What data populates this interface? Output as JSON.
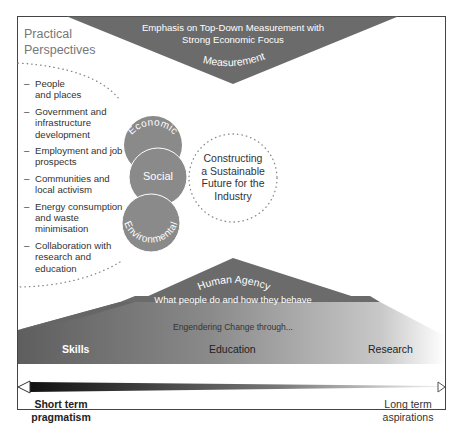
{
  "measurement": {
    "heading_line1": "Emphasis on Top-Down Measurement with",
    "heading_line2": "Strong Economic Focus",
    "label": "Measurement"
  },
  "practical_perspectives": {
    "title_line1": "Practical",
    "title_line2": "Perspectives",
    "items": [
      {
        "lines": [
          "People",
          "and places"
        ]
      },
      {
        "lines": [
          "Government and",
          "infrastructure",
          "development"
        ]
      },
      {
        "lines": [
          "Employment and job",
          "prospects"
        ]
      },
      {
        "lines": [
          "Communities and",
          "local activism"
        ]
      },
      {
        "lines": [
          "Energy consumption",
          "and waste",
          "minimisation"
        ]
      },
      {
        "lines": [
          "Collaboration with",
          "research and",
          "education"
        ]
      }
    ],
    "bullet": "–"
  },
  "pillars": {
    "economic": "Economic",
    "social": "Social",
    "environmental": "Environmental"
  },
  "goal": {
    "lines": [
      "Constructing",
      "a Sustainable",
      "Future for the",
      "Industry"
    ]
  },
  "human_agency": {
    "title": "Human Agency",
    "subtitle": "What people do and how they behave"
  },
  "change": {
    "heading": "Engendering Change through...",
    "skills": "Skills",
    "education": "Education",
    "research": "Research"
  },
  "timeline": {
    "left_line1": "Short term",
    "left_line2": "pragmatism",
    "right_line1": "Long term",
    "right_line2": "aspirations"
  },
  "colors": {
    "dark_grey": "#6b6b6b",
    "circle_grey": "#8a8a8a",
    "frame": "#444444",
    "text": "#333333",
    "muted_text": "#777777"
  }
}
